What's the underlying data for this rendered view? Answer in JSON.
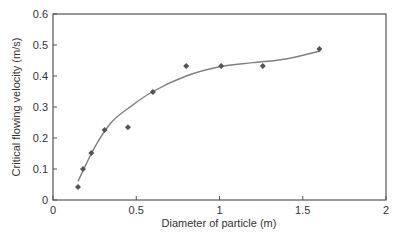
{
  "chart_data": {
    "type": "scatter",
    "title": "",
    "xlabel": "Diameter of particle (m)",
    "ylabel": "Critical flowing velocity (m/s)",
    "xlim": [
      0,
      2
    ],
    "ylim": [
      0,
      0.6
    ],
    "xticks": [
      "0",
      "0.5",
      "1",
      "1.5",
      "2"
    ],
    "yticks": [
      "0",
      "0.1",
      "0.2",
      "0.3",
      "0.4",
      "0.5",
      "0.6"
    ],
    "grid": false,
    "legend": null,
    "series": [
      {
        "name": "Measured",
        "marker": "diamond",
        "x": [
          0.15,
          0.18,
          0.23,
          0.31,
          0.45,
          0.6,
          0.8,
          1.01,
          1.26,
          1.6
        ],
        "y": [
          0.042,
          0.1,
          0.152,
          0.226,
          0.235,
          0.348,
          0.432,
          0.432,
          0.432,
          0.487
        ]
      },
      {
        "name": "Fitted curve",
        "marker": "none",
        "x": [
          0.15,
          0.25,
          0.35,
          0.45,
          0.6,
          0.8,
          1.0,
          1.2,
          1.4,
          1.6
        ],
        "y": [
          0.06,
          0.17,
          0.25,
          0.295,
          0.35,
          0.4,
          0.43,
          0.443,
          0.455,
          0.48
        ]
      }
    ]
  },
  "colors": {
    "axis": "#555555",
    "marker": "#555555",
    "curve": "#808080",
    "text": "#333333"
  }
}
